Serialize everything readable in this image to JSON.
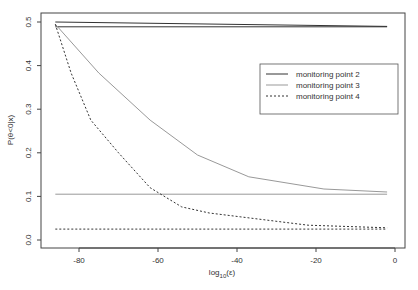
{
  "chart_data": {
    "type": "line",
    "title": "",
    "xlabel": "log10(ε)",
    "xlabel_main": "log",
    "xlabel_sub": "10",
    "xlabel_tail": "(ε)",
    "ylabel": "P(θ<0|x)",
    "xlim": [
      -88,
      1
    ],
    "ylim": [
      -0.02,
      0.52
    ],
    "xticks": [
      -80,
      -60,
      -40,
      -20,
      0
    ],
    "xtick_labels": [
      "-80",
      "-60",
      "-40",
      "-20",
      "0"
    ],
    "yticks": [
      0.0,
      0.1,
      0.2,
      0.3,
      0.4,
      0.5
    ],
    "ytick_labels": [
      "0.0",
      "0.1",
      "0.2",
      "0.3",
      "0.4",
      "0.5"
    ],
    "grid": false,
    "legend_position": "upper right (inset)",
    "series": [
      {
        "name": "monitoring point 2",
        "style": "solid",
        "color": "#333333",
        "lines": [
          {
            "x": [
              -86,
              -2
            ],
            "y": [
              0.5,
              0.49
            ]
          },
          {
            "x": [
              -86,
              -2
            ],
            "y": [
              0.489,
              0.489
            ]
          }
        ]
      },
      {
        "name": "monitoring point 3",
        "style": "solid",
        "color": "#999999",
        "lines": [
          {
            "x": [
              -86,
              -75,
              -62,
              -50,
              -37,
              -18,
              -2
            ],
            "y": [
              0.495,
              0.383,
              0.275,
              0.195,
              0.145,
              0.117,
              0.11
            ]
          },
          {
            "x": [
              -86,
              -2
            ],
            "y": [
              0.105,
              0.105
            ]
          }
        ]
      },
      {
        "name": "monitoring point 4",
        "style": "dashed",
        "color": "#333333",
        "lines": [
          {
            "x": [
              -86,
              -82,
              -77,
              -70,
              -62,
              -54,
              -47,
              -39,
              -22,
              -2
            ],
            "y": [
              0.495,
              0.383,
              0.275,
              0.2,
              0.12,
              0.076,
              0.062,
              0.053,
              0.034,
              0.028
            ]
          },
          {
            "x": [
              -86,
              -2
            ],
            "y": [
              0.025,
              0.025
            ]
          }
        ]
      }
    ]
  },
  "legend": {
    "items": [
      {
        "label": "monitoring point 2"
      },
      {
        "label": "monitoring point 3"
      },
      {
        "label": "monitoring point 4"
      }
    ]
  }
}
